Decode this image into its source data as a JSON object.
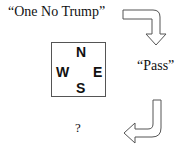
{
  "bids": {
    "first": "“One No Trump”",
    "second": "“Pass”",
    "third": "?"
  },
  "compass": {
    "north": "N",
    "west": "W",
    "east": "E",
    "south": "S"
  },
  "arrows": [
    {
      "name": "arrow-right-then-down",
      "direction": "down"
    },
    {
      "name": "arrow-down-then-left",
      "direction": "left"
    }
  ]
}
